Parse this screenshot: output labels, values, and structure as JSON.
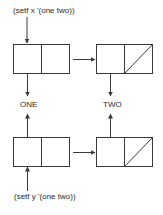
{
  "diagram": {
    "top_expression": "(setf x '(one two))",
    "bottom_expression": "(setf y '(one two))",
    "atoms": {
      "one": "ONE",
      "two": "TWO"
    },
    "colors": {
      "stroke": "#3a3a3a",
      "text": "#2a2a2a",
      "background": "#ffffff"
    },
    "structure": [
      {
        "variable": "x",
        "cells": [
          {
            "car": "ONE",
            "cdr": "next"
          },
          {
            "car": "TWO",
            "cdr": "NIL"
          }
        ]
      },
      {
        "variable": "y",
        "cells": [
          {
            "car": "ONE",
            "cdr": "next"
          },
          {
            "car": "TWO",
            "cdr": "NIL"
          }
        ]
      }
    ]
  }
}
